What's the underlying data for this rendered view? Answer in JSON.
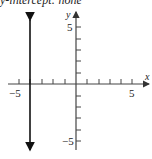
{
  "caption": "y-intercept: none",
  "graph": {
    "x_axis_label": "x",
    "y_axis_label": "y",
    "x_tick_labels": {
      "neg": "−5",
      "pos": "5"
    },
    "y_tick_labels": {
      "pos": "5",
      "neg": "−5"
    },
    "x_range": [
      -5,
      5
    ],
    "y_range": [
      -5,
      5
    ],
    "line": {
      "equation": "x = -4",
      "type": "vertical",
      "x": -4
    }
  },
  "colors": {
    "axis": "#444444",
    "line": "#111111",
    "background": "#ffffff"
  }
}
